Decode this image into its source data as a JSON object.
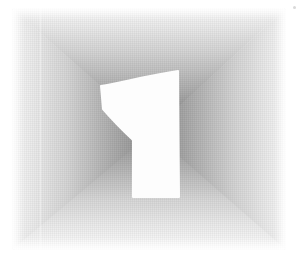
{
  "numeral": {
    "value": "1",
    "fill": "#fdfdfd"
  },
  "background": {
    "page_color": "#ffffff",
    "outer_edge_color": "#fafafa",
    "center_dark_color": "#7e7e7e"
  }
}
